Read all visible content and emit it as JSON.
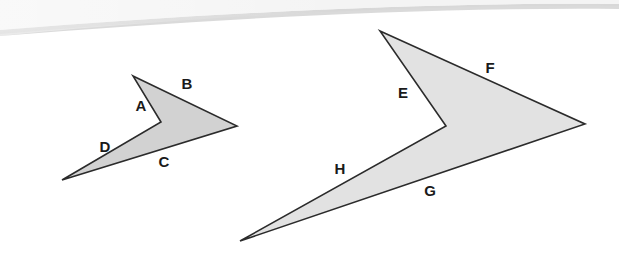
{
  "canvas": {
    "width": 619,
    "height": 261,
    "background_color": "#ffffff"
  },
  "background_band": {
    "name": "page-edge-shadow-band",
    "description": "subtle curved light-gray arc across top of image",
    "color_light": "#f1f1f1",
    "color_mid": "#e3e3e3",
    "color_edge": "#c9c9c9"
  },
  "figure": {
    "stroke_color": "#2b2b2b",
    "stroke_width": 1.6,
    "shapes": [
      {
        "id": "left-arrow",
        "name": "left-arrow-polygon",
        "fill_color": "#d2d2d2",
        "points": "133,76 237,126 62,180 161,122",
        "vertices": [
          {
            "x": 133,
            "y": 76
          },
          {
            "x": 237,
            "y": 126
          },
          {
            "x": 62,
            "y": 180
          },
          {
            "x": 161,
            "y": 122
          }
        ],
        "labels": [
          {
            "text": "A",
            "x": 141,
            "y": 107
          },
          {
            "text": "B",
            "x": 187,
            "y": 85
          },
          {
            "text": "C",
            "x": 164,
            "y": 163
          },
          {
            "text": "D",
            "x": 105,
            "y": 148
          }
        ]
      },
      {
        "id": "right-arrow",
        "name": "right-arrow-polygon",
        "fill_color": "#e2e2e2",
        "points": "380,31 585,124 240,241 446,126",
        "vertices": [
          {
            "x": 380,
            "y": 31
          },
          {
            "x": 585,
            "y": 124
          },
          {
            "x": 240,
            "y": 241
          },
          {
            "x": 446,
            "y": 126
          }
        ],
        "labels": [
          {
            "text": "E",
            "x": 403,
            "y": 94
          },
          {
            "text": "F",
            "x": 490,
            "y": 69
          },
          {
            "text": "G",
            "x": 430,
            "y": 192
          },
          {
            "text": "H",
            "x": 340,
            "y": 170
          }
        ]
      }
    ]
  }
}
